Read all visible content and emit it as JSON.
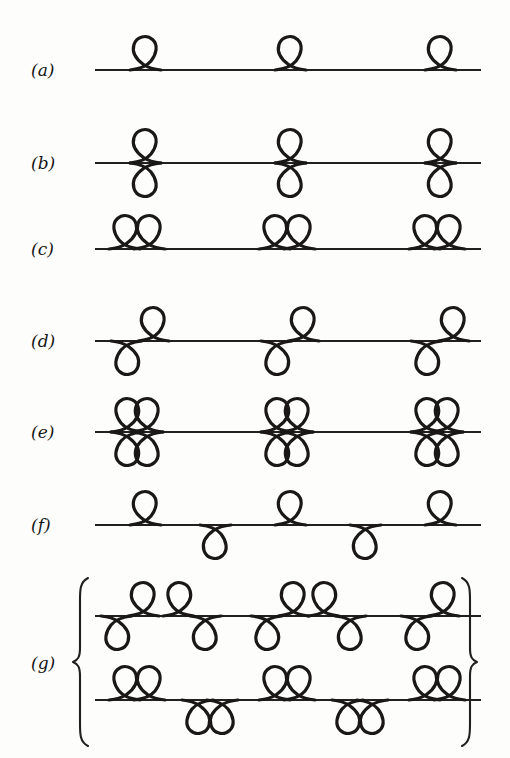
{
  "figure": {
    "background_color": "#fdfdfb",
    "ink_color": "#1a1816",
    "line_color": "#22201e",
    "rows": [
      {
        "id": "a",
        "label": "(a)",
        "node_type": "single-loop-above",
        "description": "one teardrop loop above the axis at each node",
        "axis_y": 70,
        "line_x1": 95,
        "line_x2": 481,
        "nodes": [
          146,
          291,
          441
        ],
        "loops_above": 1,
        "loops_below": 0
      },
      {
        "id": "b",
        "label": "(b)",
        "node_type": "double-loop-vertical",
        "description": "one loop above and one loop below the axis, cusp opening left",
        "axis_y": 163,
        "line_x1": 95,
        "line_x2": 481,
        "nodes": [
          146,
          291,
          441
        ],
        "loops_above": 1,
        "loops_below": 1
      },
      {
        "id": "c",
        "label": "(c)",
        "node_type": "double-loop-above",
        "description": "two mirrored loops both above the axis",
        "axis_y": 249,
        "line_x1": 95,
        "line_x2": 481,
        "nodes": [
          137,
          287,
          437
        ],
        "loops_above": 2,
        "loops_below": 0
      },
      {
        "id": "d",
        "label": "(d)",
        "node_type": "s-curve",
        "description": "S shaped curve, loop above right and loop below left",
        "axis_y": 341,
        "line_x1": 95,
        "line_x2": 481,
        "nodes": [
          140,
          290,
          440
        ],
        "loops_above": 1,
        "loops_below": 1
      },
      {
        "id": "e",
        "label": "(e)",
        "node_type": "quadruple-loop",
        "description": "four loops arranged as a flower around the node",
        "axis_y": 432,
        "line_x1": 95,
        "line_x2": 481,
        "nodes": [
          137,
          287,
          437
        ],
        "loops_above": 2,
        "loops_below": 2
      },
      {
        "id": "f",
        "label": "(f)",
        "node_type": "alternating-loops",
        "description": "loops alternating above and below the axis",
        "axis_y": 525,
        "line_x1": 95,
        "line_x2": 481,
        "nodes_above": [
          146,
          291,
          441
        ],
        "nodes_below": [
          216,
          366
        ],
        "loops_above": 1,
        "loops_below": 1
      },
      {
        "id": "g",
        "label": "(g)",
        "node_type": "grouped-pair",
        "description": "brace grouping two lines of combined node patterns",
        "braced": true,
        "brace_left_x": 78,
        "brace_right_x": 470,
        "brace_top": 576,
        "brace_bottom": 748,
        "sublines": [
          {
            "index": 1,
            "axis_y": 616,
            "line_x1": 95,
            "line_x2": 481,
            "pattern": "mirrored S-curve pairs",
            "nodes": [
              130,
              192,
              280,
              337,
              430
            ],
            "mirrored_flags": [
              false,
              true,
              false,
              true,
              false
            ]
          },
          {
            "index": 2,
            "axis_y": 700,
            "line_x1": 95,
            "line_x2": 481,
            "pattern": "double loops above alternating with double loops below",
            "nodes_above": [
              137,
              287,
              437
            ],
            "nodes_below": [
              210,
              360
            ]
          }
        ]
      }
    ]
  }
}
